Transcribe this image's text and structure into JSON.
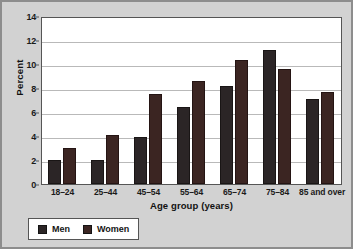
{
  "chart_data": {
    "type": "bar",
    "title": "",
    "xlabel": "Age group (years)",
    "ylabel": "Percent",
    "ylim": [
      0,
      14
    ],
    "yticks": [
      0,
      2,
      4,
      6,
      8,
      10,
      12,
      14
    ],
    "grid": true,
    "legend_position": "bottom-left",
    "categories": [
      "18–24",
      "25–44",
      "45–54",
      "55–64",
      "65–74",
      "75–84",
      "85 and over"
    ],
    "series": [
      {
        "name": "Men",
        "color": "#2b2526",
        "values": [
          2.0,
          2.0,
          3.9,
          6.4,
          8.2,
          11.2,
          7.1
        ]
      },
      {
        "name": "Women",
        "color": "#3b2522",
        "values": [
          3.0,
          4.1,
          7.5,
          8.6,
          10.3,
          9.6,
          7.7
        ]
      }
    ]
  },
  "axis": {
    "y_tick_labels": [
      "0",
      "2",
      "4",
      "6",
      "8",
      "10",
      "12",
      "14"
    ],
    "y_title": "Percent",
    "x_title": "Age group (years)"
  },
  "legend": {
    "items": [
      {
        "label": "Men",
        "color": "#2b2526"
      },
      {
        "label": "Women",
        "color": "#3b2522"
      }
    ]
  }
}
